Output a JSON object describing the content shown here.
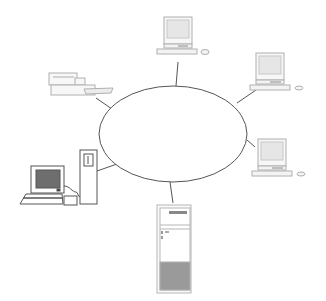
{
  "diagram": {
    "type": "network-topology",
    "topology": "ring/bus (ellipse network cloud)",
    "colors": {
      "line": "#555555",
      "device_outline": "#b0b0b0",
      "screen_light": "#e6e6e6",
      "screen_dark": "#6e6e6e",
      "background": "#ffffff"
    },
    "network": {
      "name": "network-ellipse",
      "cx": 173,
      "cy": 134,
      "rx": 74,
      "ry": 48
    },
    "nodes": [
      {
        "id": "workstation-top",
        "kind": "desktop computer",
        "position": "top"
      },
      {
        "id": "workstation-right-upper",
        "kind": "desktop computer",
        "position": "right-upper"
      },
      {
        "id": "workstation-right-lower",
        "kind": "desktop computer",
        "position": "right-lower"
      },
      {
        "id": "printer",
        "kind": "laser printer",
        "position": "left-upper"
      },
      {
        "id": "workstation-left",
        "kind": "desktop computer with tower",
        "position": "left-lower"
      },
      {
        "id": "server",
        "kind": "tower server",
        "position": "bottom"
      }
    ]
  }
}
